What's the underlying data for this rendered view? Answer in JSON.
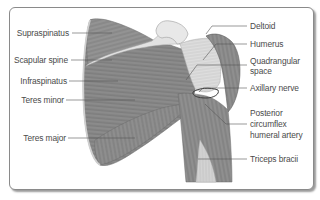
{
  "diagram": {
    "labels_left": [
      {
        "id": "supraspinatus",
        "text": "Supraspinatus"
      },
      {
        "id": "scapular-spine",
        "text": "Scapular spine"
      },
      {
        "id": "infraspinatus",
        "text": "Infraspinatus"
      },
      {
        "id": "teres-minor",
        "text": "Teres minor"
      },
      {
        "id": "teres-major",
        "text": "Teres major"
      }
    ],
    "labels_right": [
      {
        "id": "deltoid",
        "text": "Deltoid"
      },
      {
        "id": "humerus",
        "text": "Humerus"
      },
      {
        "id": "quadrangular-space",
        "line1": "Quadrangular",
        "line2": "space"
      },
      {
        "id": "axillary-nerve",
        "text": "Axillary nerve"
      },
      {
        "id": "posterior-circumflex-humeral-artery",
        "line1": "Posterior",
        "line2": "circumflex",
        "line3": "humeral artery"
      },
      {
        "id": "triceps-bracii",
        "text": "Triceps bracii"
      }
    ],
    "colors": {
      "muscle": "#8c8c8c",
      "muscle_dark": "#6f6f6f",
      "bone": "#e6e6e6",
      "tendon": "#d0d0d0",
      "border": "#8a8a8a",
      "label_text": "#4a4a4a",
      "leader_line": "#555555"
    }
  }
}
